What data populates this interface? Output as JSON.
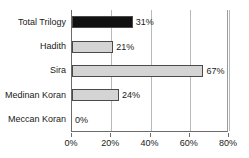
{
  "chart_data": {
    "type": "bar",
    "orientation": "horizontal",
    "title": "",
    "subtitle": "",
    "xlabel": "",
    "ylabel": "",
    "categories": [
      "Total Trilogy",
      "Hadith",
      "Sira",
      "Medinan Koran",
      "Meccan Koran"
    ],
    "values": [
      31,
      21,
      67,
      24,
      0
    ],
    "data_labels": [
      "31%",
      "21%",
      "67%",
      "24%",
      "0%"
    ],
    "xlim": [
      0,
      80
    ],
    "xticks": [
      0,
      20,
      40,
      60,
      80
    ],
    "xtick_labels": [
      "0%",
      "20%",
      "40%",
      "60%",
      "80%"
    ],
    "grid": true,
    "grid_axis": "x",
    "legend": false,
    "bar_colors": [
      "#111111",
      "#d4d4d4",
      "#d4d4d4",
      "#d4d4d4",
      "#d4d4d4"
    ],
    "bar_border_color": "#4a4a4a",
    "axis_color": "#6b6b6b",
    "gridline_color": "#b9b9b9",
    "text_color": "#1a1a1a",
    "background": "#ffffff"
  }
}
